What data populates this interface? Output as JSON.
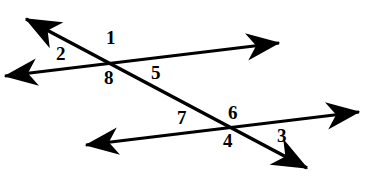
{
  "figure": {
    "type": "geometry-diagram",
    "width": 386,
    "height": 190,
    "background_color": "#ffffff",
    "stroke_color": "#000000",
    "stroke_width": 3.2
  },
  "lines": [
    {
      "name": "upper-parallel-line",
      "x1": 5,
      "y1": 76,
      "x2": 279,
      "y2": 43,
      "arrow_start": true,
      "arrow_end": true
    },
    {
      "name": "lower-parallel-line",
      "x1": 86,
      "y1": 145,
      "x2": 359,
      "y2": 112,
      "arrow_start": true,
      "arrow_end": true
    },
    {
      "name": "transversal-line",
      "x1": 26,
      "y1": 19,
      "x2": 307,
      "y2": 168,
      "arrow_start": true,
      "arrow_end": true
    }
  ],
  "intersections": [
    {
      "name": "upper-intersection",
      "x": 110,
      "y": 63
    },
    {
      "name": "lower-intersection",
      "x": 233,
      "y": 128
    }
  ],
  "labels": [
    {
      "id": "angle-1",
      "text": "1",
      "x": 106,
      "y": 28
    },
    {
      "id": "angle-2",
      "text": "2",
      "x": 56,
      "y": 44
    },
    {
      "id": "angle-8",
      "text": "8",
      "x": 104,
      "y": 68
    },
    {
      "id": "angle-5",
      "text": "5",
      "x": 151,
      "y": 63
    },
    {
      "id": "angle-7",
      "text": "7",
      "x": 177,
      "y": 108
    },
    {
      "id": "angle-6",
      "text": "6",
      "x": 228,
      "y": 103
    },
    {
      "id": "angle-4",
      "text": "4",
      "x": 223,
      "y": 131
    },
    {
      "id": "angle-3",
      "text": "3",
      "x": 277,
      "y": 126
    }
  ]
}
